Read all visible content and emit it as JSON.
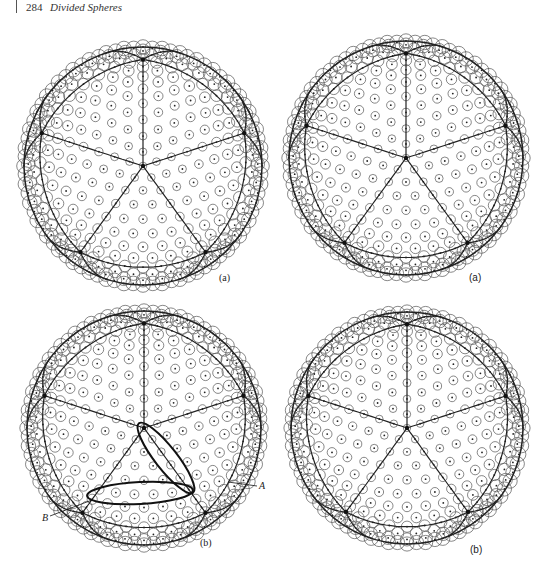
{
  "header": {
    "page_number": "284",
    "running_title": "Divided Spheres"
  },
  "figures": [
    {
      "id": "top-left",
      "panel_label": "(a)",
      "label_style": "serif",
      "center": [
        143,
        166
      ],
      "radius": 119,
      "rotation_deg": 0,
      "label_pos": [
        219,
        281
      ],
      "annotations": []
    },
    {
      "id": "top-right",
      "panel_label": "(a)",
      "label_style": "sans",
      "center": [
        406,
        158
      ],
      "radius": 117,
      "rotation_deg": 0,
      "label_pos": [
        469,
        281
      ],
      "annotations": []
    },
    {
      "id": "bottom-left",
      "panel_label": "(b)",
      "label_style": "serif",
      "center": [
        144,
        428
      ],
      "radius": 117,
      "rotation_deg": 0,
      "label_pos": [
        200,
        546
      ],
      "annotations": [
        {
          "label": "A",
          "text_pos": [
            259,
            489
          ],
          "leader": [
            [
              228,
              482
            ],
            [
              257,
              486
            ]
          ],
          "ellipse": {
            "cx": 166,
            "cy": 458,
            "rx": 44,
            "ry": 11,
            "angle": 52
          }
        },
        {
          "label": "B",
          "text_pos": [
            42,
            521
          ],
          "leader": [
            [
              50,
              516
            ],
            [
              92,
              500
            ]
          ],
          "ellipse": {
            "cx": 140,
            "cy": 493,
            "rx": 53,
            "ry": 11,
            "angle": -3
          }
        }
      ]
    },
    {
      "id": "bottom-right",
      "panel_label": "(b)",
      "label_style": "sans",
      "center": [
        407,
        428
      ],
      "radius": 116,
      "rotation_deg": 0,
      "label_pos": [
        470,
        553
      ],
      "annotations": []
    }
  ],
  "style": {
    "line_color": "#222222",
    "circle_color": "#555555",
    "background": "#ffffff"
  }
}
